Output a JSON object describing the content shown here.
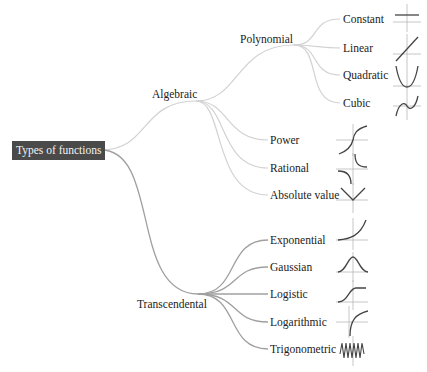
{
  "root": {
    "label": "Types of functions",
    "bg": "#4a4a4a"
  },
  "colors": {
    "algebraic_link": "#cfcfcf",
    "transcendental_link": "#9a9a9a",
    "curve": "#444444",
    "axis": "#b8b8b8"
  },
  "algebraic": {
    "label": "Algebraic",
    "polynomial": {
      "label": "Polynomial",
      "children": [
        {
          "label": "Constant",
          "icon": "constant-graph-icon"
        },
        {
          "label": "Linear",
          "icon": "linear-graph-icon"
        },
        {
          "label": "Quadratic",
          "icon": "quadratic-graph-icon"
        },
        {
          "label": "Cubic",
          "icon": "cubic-graph-icon"
        }
      ]
    },
    "others": [
      {
        "label": "Power",
        "icon": "power-graph-icon"
      },
      {
        "label": "Rational",
        "icon": "rational-graph-icon"
      },
      {
        "label": "Absolute value",
        "icon": "absolute-value-graph-icon"
      }
    ]
  },
  "transcendental": {
    "label": "Transcendental",
    "children": [
      {
        "label": "Exponential",
        "icon": "exponential-graph-icon"
      },
      {
        "label": "Gaussian",
        "icon": "gaussian-graph-icon"
      },
      {
        "label": "Logistic",
        "icon": "logistic-graph-icon"
      },
      {
        "label": "Logarithmic",
        "icon": "logarithmic-graph-icon"
      },
      {
        "label": "Trigonometric",
        "icon": "trigonometric-graph-icon"
      }
    ]
  }
}
